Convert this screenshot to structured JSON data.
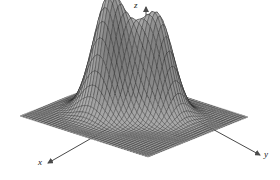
{
  "figure": {
    "type": "surface-plot-3d",
    "background_color": "#ffffff",
    "mesh_line_color": "#1a1a1a",
    "surface_fill_light": "#f2f2f2",
    "surface_fill_dark": "#6e6e6e",
    "axis_color": "#4a4a4a"
  },
  "axes": {
    "z": {
      "label": "z",
      "arrow": "up",
      "name": "z-axis"
    },
    "x": {
      "label": "x",
      "arrow": "down-left",
      "name": "x-axis"
    },
    "y": {
      "label": "y",
      "arrow": "down-right",
      "name": "y-axis"
    }
  },
  "chart_data": {
    "type": "surface",
    "title": "",
    "xlabel": "x",
    "ylabel": "y",
    "zlabel": "z",
    "grid": true,
    "legend": null,
    "projection": "isometric-3d-wireframe",
    "xlim": [
      -3,
      3
    ],
    "ylim": [
      -3,
      3
    ],
    "zlim": [
      0,
      1
    ],
    "grid_n": 44,
    "peaks": [
      {
        "name": "left-peak",
        "cx": -0.85,
        "cy": -0.35,
        "amplitude": 1.0,
        "sigma_x": 0.62,
        "sigma_y": 0.62
      },
      {
        "name": "right-peak",
        "cx": 0.55,
        "cy": 0.75,
        "amplitude": 0.82,
        "sigma_x": 0.58,
        "sigma_y": 0.58
      },
      {
        "name": "center-bump",
        "cx": -0.1,
        "cy": 0.25,
        "amplitude": 0.2,
        "sigma_x": 0.42,
        "sigma_y": 0.42
      }
    ],
    "view": {
      "azimuth_deg": 35,
      "elevation_deg": 28
    }
  }
}
